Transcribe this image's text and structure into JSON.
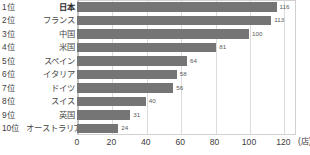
{
  "chart_data": {
    "type": "bar",
    "orientation": "horizontal",
    "title": "",
    "xlabel": "(店)",
    "ylabel": "",
    "xlim": [
      0,
      128
    ],
    "xticks": [
      0,
      20,
      40,
      60,
      80,
      100,
      120
    ],
    "xtick_labels": [
      "0",
      "20",
      "40",
      "60",
      "80",
      "100",
      "120"
    ],
    "grid": true,
    "legend": false,
    "categories": [
      "日本",
      "フランス",
      "中国",
      "米国",
      "スペイン",
      "イタリア",
      "ドイツ",
      "スイス",
      "英国",
      "オーストラリア"
    ],
    "values": [
      116,
      113,
      100,
      81,
      64,
      58,
      56,
      40,
      31,
      24
    ],
    "value_labels": [
      "116",
      "113",
      "100",
      "81",
      "64",
      "58",
      "56",
      "40",
      "31",
      "24"
    ],
    "rank_labels": [
      "1位",
      "2位",
      "3位",
      "4位",
      "5位",
      "6位",
      "7位",
      "8位",
      "9位",
      "10位"
    ],
    "highlight_index": 0,
    "bar_color": "#757575",
    "grid_color": "#dcdcdc",
    "border_color": "#d0d0d0"
  },
  "rows": [
    {
      "rank": "1位",
      "name": "日本",
      "value": 116,
      "label": "116",
      "bold": true
    },
    {
      "rank": "2位",
      "name": "フランス",
      "value": 113,
      "label": "113",
      "bold": false
    },
    {
      "rank": "3位",
      "name": "中国",
      "value": 100,
      "label": "100",
      "bold": false
    },
    {
      "rank": "4位",
      "name": "米国",
      "value": 81,
      "label": "81",
      "bold": false
    },
    {
      "rank": "5位",
      "name": "スペイン",
      "value": 64,
      "label": "64",
      "bold": false
    },
    {
      "rank": "6位",
      "name": "イタリア",
      "value": 58,
      "label": "58",
      "bold": false
    },
    {
      "rank": "7位",
      "name": "ドイツ",
      "value": 56,
      "label": "56",
      "bold": false
    },
    {
      "rank": "8位",
      "name": "スイス",
      "value": 40,
      "label": "40",
      "bold": false
    },
    {
      "rank": "9位",
      "name": "英国",
      "value": 31,
      "label": "31",
      "bold": false
    },
    {
      "rank": "10位",
      "name": "オーストラリア",
      "value": 24,
      "label": "24",
      "bold": false
    }
  ],
  "axis": {
    "unit": "(店)",
    "ticks": [
      "0",
      "20",
      "40",
      "60",
      "80",
      "100",
      "120"
    ]
  }
}
